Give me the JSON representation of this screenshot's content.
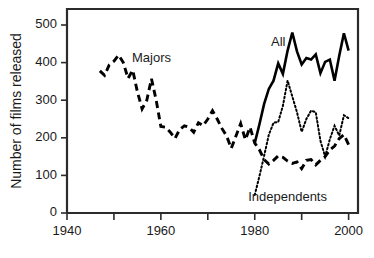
{
  "chart_data": {
    "type": "line",
    "title": "",
    "subtitle": "",
    "xlabel": "",
    "ylabel": "Number of films released",
    "xlim": [
      1940,
      2002
    ],
    "ylim": [
      0,
      530
    ],
    "grid": false,
    "legend_position": "inline-annotations",
    "x_ticks": [
      1940,
      1950,
      1960,
      1970,
      1980,
      1990,
      2000
    ],
    "x_tick_labels": [
      "1940",
      "",
      "1960",
      "",
      "1980",
      "",
      "2000"
    ],
    "y_ticks": [
      0,
      100,
      200,
      300,
      400,
      500
    ],
    "y_tick_labels": [
      "0",
      "100",
      "200",
      "300",
      "400",
      "500"
    ],
    "annotations": [
      {
        "text": "Majors",
        "x": 1958,
        "y": 410
      },
      {
        "text": "All",
        "x": 1985,
        "y": 452
      },
      {
        "text": "Independents",
        "x": 1987,
        "y": 42
      }
    ],
    "series": [
      {
        "name": "Majors",
        "style": "dashed",
        "color": "#000000",
        "x": [
          1947,
          1948,
          1949,
          1950,
          1951,
          1952,
          1953,
          1954,
          1955,
          1956,
          1957,
          1958,
          1959,
          1960,
          1961,
          1962,
          1963,
          1964,
          1965,
          1966,
          1967,
          1968,
          1969,
          1970,
          1971,
          1972,
          1973,
          1974,
          1975,
          1976,
          1977,
          1978,
          1979,
          1980,
          1981,
          1982,
          1983,
          1984,
          1985,
          1986,
          1987,
          1988,
          1989,
          1990,
          1991,
          1992,
          1993,
          1994,
          1995,
          1996,
          1997,
          1998,
          1999,
          2000
        ],
        "values": [
          378,
          366,
          394,
          404,
          420,
          400,
          358,
          380,
          322,
          277,
          300,
          357,
          300,
          230,
          228,
          215,
          198,
          222,
          232,
          228,
          215,
          240,
          232,
          250,
          272,
          250,
          225,
          205,
          172,
          205,
          238,
          195,
          228,
          186,
          168,
          142,
          130,
          140,
          152,
          148,
          138,
          132,
          136,
          118,
          140,
          142,
          128,
          140,
          150,
          168,
          178,
          198,
          208,
          182
        ]
      },
      {
        "name": "All",
        "style": "solid",
        "color": "#000000",
        "x": [
          1980,
          1981,
          1982,
          1983,
          1984,
          1985,
          1986,
          1987,
          1988,
          1989,
          1990,
          1991,
          1992,
          1993,
          1994,
          1995,
          1996,
          1997,
          1998,
          1999,
          2000
        ],
        "values": [
          186,
          236,
          290,
          330,
          352,
          398,
          370,
          432,
          480,
          430,
          395,
          412,
          408,
          422,
          372,
          402,
          408,
          352,
          418,
          478,
          432
        ]
      },
      {
        "name": "Independents",
        "style": "dotted",
        "color": "#000000",
        "x": [
          1980,
          1981,
          1982,
          1983,
          1984,
          1985,
          1986,
          1987,
          1988,
          1989,
          1990,
          1991,
          1992,
          1993,
          1994,
          1995,
          1996,
          1997,
          1998,
          1999,
          2000
        ],
        "values": [
          48,
          98,
          152,
          208,
          240,
          242,
          285,
          352,
          310,
          268,
          216,
          250,
          272,
          268,
          192,
          150,
          196,
          232,
          206,
          260,
          252
        ]
      }
    ]
  }
}
